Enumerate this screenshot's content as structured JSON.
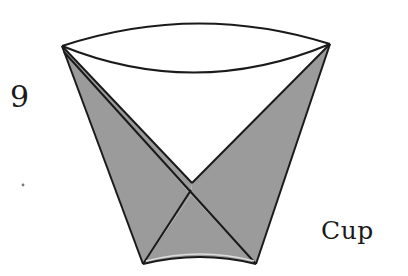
{
  "figure": {
    "step_number": "9",
    "caption": "Cup",
    "colors": {
      "paper_fill": "#9b9b9b",
      "outline": "#1a1a1a",
      "background": "#ffffff",
      "highlight": "#d8d8d8"
    },
    "points": {
      "left_corner": [
        62,
        46
      ],
      "right_corner": [
        330,
        44
      ],
      "v_apex": [
        192,
        183
      ],
      "cross": [
        191,
        195
      ],
      "bottom_left": [
        143,
        264
      ],
      "bottom_right": [
        256,
        264
      ]
    }
  }
}
